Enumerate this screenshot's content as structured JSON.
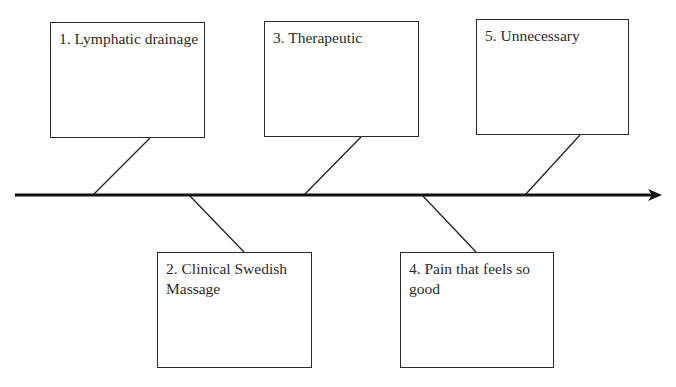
{
  "diagram": {
    "type": "fishbone",
    "spine": {
      "x1": 15,
      "y": 195,
      "x2": 662,
      "arrow": true,
      "color": "#111111"
    },
    "boxes": [
      {
        "id": 1,
        "label": "1. Lymphatic drainage",
        "x": 50,
        "y": 22,
        "w": 155,
        "h": 116,
        "side": "top",
        "connector": {
          "x1": 150,
          "y1": 138,
          "x2": 93,
          "y2": 195
        }
      },
      {
        "id": 2,
        "label": "2. Clinical Swedish Massage",
        "x": 157,
        "y": 252,
        "w": 155,
        "h": 116,
        "side": "bottom",
        "connector": {
          "x1": 189,
          "y1": 195,
          "x2": 244,
          "y2": 252
        }
      },
      {
        "id": 3,
        "label": "3. Therapeutic",
        "x": 264,
        "y": 21,
        "w": 155,
        "h": 116,
        "side": "top",
        "connector": {
          "x1": 361,
          "y1": 137,
          "x2": 304,
          "y2": 195
        }
      },
      {
        "id": 4,
        "label": "4. Pain that feels so good",
        "x": 400,
        "y": 252,
        "w": 154,
        "h": 116,
        "side": "bottom",
        "connector": {
          "x1": 422,
          "y1": 195,
          "x2": 476,
          "y2": 252
        }
      },
      {
        "id": 5,
        "label": "5. Unnecessary",
        "x": 476,
        "y": 19,
        "w": 153,
        "h": 116,
        "side": "top",
        "connector": {
          "x1": 580,
          "y1": 135,
          "x2": 525,
          "y2": 195
        }
      }
    ]
  }
}
